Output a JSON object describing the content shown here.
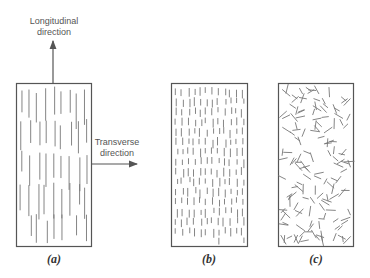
{
  "diagram": {
    "panels": [
      {
        "id": "a",
        "caption": "(a)",
        "fiber_type": "continuous aligned"
      },
      {
        "id": "b",
        "caption": "(b)",
        "fiber_type": "discontinuous aligned"
      },
      {
        "id": "c",
        "caption": "(c)",
        "fiber_type": "discontinuous random"
      }
    ],
    "arrows": {
      "longitudinal": {
        "line1": "Longitudinal",
        "line2": "direction"
      },
      "transverse": {
        "line1": "Transverse",
        "line2": "direction"
      }
    },
    "colors": {
      "border": "#555555",
      "fiber": "#777777",
      "arrow": "#555555"
    }
  }
}
